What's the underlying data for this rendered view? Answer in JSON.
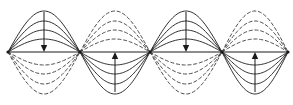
{
  "figure": {
    "line_color": "#1a1a1a",
    "dashed_color": "#3a3a3a",
    "background_color": "#ffffff",
    "canvas": {
      "width": 293,
      "height": 105
    }
  },
  "chart_data": {
    "type": "line",
    "title": "",
    "xlabel": "",
    "ylabel": "",
    "grid": false,
    "legend_position": "none",
    "axis": {
      "baseline_y": 52,
      "x_start": 8,
      "x_end": 288
    },
    "nodes": [
      {
        "label": "node-1",
        "x": 8,
        "y": 52
      },
      {
        "label": "node-2",
        "x": 80,
        "y": 52
      },
      {
        "label": "node-3",
        "x": 150,
        "y": 52
      },
      {
        "label": "node-4",
        "x": 222,
        "y": 52
      },
      {
        "label": "node-5",
        "x": 288,
        "y": 52
      }
    ],
    "antinodes": [
      {
        "label": "antinode-1",
        "x": 44,
        "side": "above",
        "style": "solid",
        "peak_y": 11
      },
      {
        "label": "antinode-2",
        "x": 115,
        "side": "above",
        "style": "dashed",
        "peak_y": 11
      },
      {
        "label": "antinode-3",
        "x": 186,
        "side": "above",
        "style": "solid",
        "peak_y": 11
      },
      {
        "label": "antinode-4",
        "x": 255,
        "side": "above",
        "style": "dashed",
        "peak_y": 11
      }
    ],
    "lobes": [
      {
        "label": "lobe-1-upper",
        "x_left": 8,
        "x_right": 80,
        "side": "above",
        "style": "solid",
        "amplitudes": [
          41,
          31,
          22,
          13
        ]
      },
      {
        "label": "lobe-1-lower",
        "x_left": 8,
        "x_right": 80,
        "side": "below",
        "style": "dashed",
        "amplitudes": [
          42,
          32,
          22,
          13
        ]
      },
      {
        "label": "lobe-2-upper",
        "x_left": 80,
        "x_right": 150,
        "side": "above",
        "style": "dashed",
        "amplitudes": [
          41,
          31,
          22,
          13
        ]
      },
      {
        "label": "lobe-2-lower",
        "x_left": 80,
        "x_right": 150,
        "side": "below",
        "style": "solid",
        "amplitudes": [
          42,
          32,
          22,
          13
        ]
      },
      {
        "label": "lobe-3-upper",
        "x_left": 150,
        "x_right": 222,
        "side": "above",
        "style": "solid",
        "amplitudes": [
          41,
          31,
          22,
          13
        ]
      },
      {
        "label": "lobe-3-lower",
        "x_left": 150,
        "x_right": 222,
        "side": "below",
        "style": "dashed",
        "amplitudes": [
          42,
          32,
          22,
          13
        ]
      },
      {
        "label": "lobe-4-upper",
        "x_left": 222,
        "x_right": 288,
        "side": "above",
        "style": "dashed",
        "amplitudes": [
          41,
          31,
          22,
          13
        ]
      },
      {
        "label": "lobe-4-lower",
        "x_left": 222,
        "x_right": 288,
        "side": "below",
        "style": "solid",
        "amplitudes": [
          42,
          32,
          22,
          13
        ]
      }
    ],
    "arrows": [
      {
        "label": "arrow-1",
        "x": 44,
        "y_tail": 12,
        "y_head": 52,
        "direction": "down"
      },
      {
        "label": "arrow-2",
        "x": 115,
        "y_tail": 92,
        "y_head": 52,
        "direction": "up"
      },
      {
        "label": "arrow-3",
        "x": 186,
        "y_tail": 12,
        "y_head": 52,
        "direction": "down"
      },
      {
        "label": "arrow-4",
        "x": 255,
        "y_tail": 92,
        "y_head": 52,
        "direction": "up"
      }
    ]
  }
}
